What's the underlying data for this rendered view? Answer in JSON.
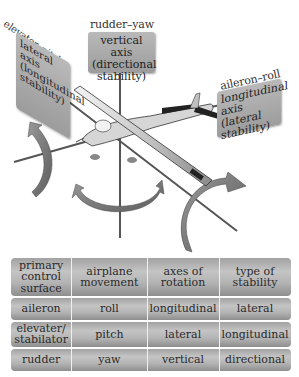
{
  "labels": {
    "elevator": "elevator–pitch",
    "rudder": "rudder–yaw",
    "aileron": "aileron–roll"
  },
  "boxes": {
    "lateral": [
      "lateral axis",
      "(longitudinal",
      "stability)"
    ],
    "vertical": [
      "vertical axis",
      "(directional",
      "stability)"
    ],
    "longitudinal": [
      "longitudinal",
      "axis (lateral",
      "stability)"
    ]
  },
  "table": {
    "headers": [
      "primary control surface",
      "airplane movement",
      "axes of rotation",
      "type of stability"
    ],
    "rows": [
      [
        "aileron",
        "roll",
        "longitudinal",
        "lateral"
      ],
      [
        "elevater/ stabilator",
        "pitch",
        "lateral",
        "longitudinal"
      ],
      [
        "rudder",
        "yaw",
        "vertical",
        "directional"
      ]
    ]
  }
}
